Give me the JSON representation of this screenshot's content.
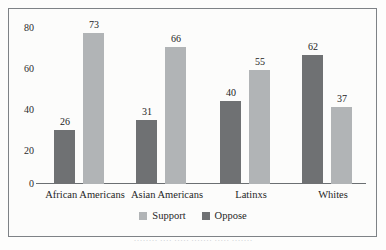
{
  "chart_data": {
    "type": "bar",
    "title": "",
    "xlabel": "",
    "ylabel": "",
    "ylim": [
      0,
      80
    ],
    "yticks": [
      "0",
      "20",
      "40",
      "60",
      "80"
    ],
    "grid": false,
    "legend_position": "bottom",
    "categories": [
      "African Americans",
      "Asian Americans",
      "Latinxs",
      "Whites"
    ],
    "series": [
      {
        "name": "Oppose",
        "color": "#6f7173",
        "values": [
          26,
          31,
          40,
          62
        ]
      },
      {
        "name": "Support",
        "color": "#b1b4b6",
        "values": [
          73,
          66,
          55,
          37
        ]
      }
    ],
    "bar_order_in_group": [
      "Oppose",
      "Support"
    ],
    "data_labels": [
      {
        "category": "African Americans",
        "oppose": "26",
        "support": "73"
      },
      {
        "category": "Asian Americans",
        "oppose": "31",
        "support": "66"
      },
      {
        "category": "Latinxs",
        "oppose": "40",
        "support": "55"
      },
      {
        "category": "Whites",
        "oppose": "62",
        "support": "37"
      }
    ]
  },
  "axis": {
    "y_ticks": [
      {
        "label": "80",
        "value": 80
      },
      {
        "label": "60",
        "value": 60
      },
      {
        "label": "40",
        "value": 40
      },
      {
        "label": "20",
        "value": 20
      },
      {
        "label": "0",
        "value": 0
      }
    ]
  },
  "legend": {
    "items": [
      {
        "label": "Support",
        "swatch": "support"
      },
      {
        "label": "Oppose",
        "swatch": "oppose"
      }
    ]
  },
  "caption": {
    "text": "········ ···· ····· ······· ····· ·······"
  },
  "colors": {
    "oppose": "#6f7173",
    "support": "#b1b4b6",
    "frame": "#7e8286",
    "axis": "#6b6f72",
    "text": "#1f1f1f",
    "background": "#fcfcfb"
  }
}
